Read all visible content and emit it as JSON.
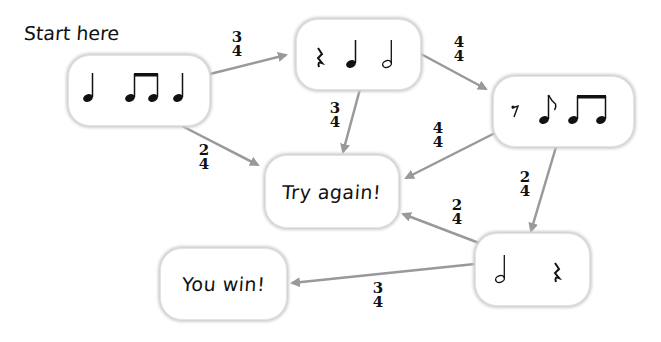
{
  "start_label": "Start here",
  "nodes": {
    "start": {
      "content": "quarter, eighth-eighth (beamed), eighth, quarter",
      "symbols": [
        "quarter-note",
        "beamed-eighth-notes",
        "quarter-note"
      ]
    },
    "top": {
      "symbols": [
        "quarter-rest",
        "quarter-note",
        "half-note"
      ]
    },
    "right": {
      "symbols": [
        "eighth-rest",
        "eighth-note",
        "beamed-eighth-notes"
      ]
    },
    "bottom_right": {
      "symbols": [
        "half-note",
        "quarter-rest"
      ]
    },
    "try_again": {
      "label": "Try again!"
    },
    "you_win": {
      "label": "You win!"
    }
  },
  "edges": [
    {
      "from": "start",
      "to": "top",
      "time_signature": {
        "top": "3",
        "bottom": "4"
      }
    },
    {
      "from": "start",
      "to": "try_again",
      "time_signature": {
        "top": "2",
        "bottom": "4"
      }
    },
    {
      "from": "top",
      "to": "right",
      "time_signature": {
        "top": "4",
        "bottom": "4"
      }
    },
    {
      "from": "top",
      "to": "try_again",
      "time_signature": {
        "top": "3",
        "bottom": "4"
      }
    },
    {
      "from": "right",
      "to": "try_again",
      "time_signature": {
        "top": "4",
        "bottom": "4"
      }
    },
    {
      "from": "right",
      "to": "bottom_right",
      "time_signature": {
        "top": "2",
        "bottom": "4"
      }
    },
    {
      "from": "bottom_right",
      "to": "try_again",
      "time_signature": {
        "top": "2",
        "bottom": "4"
      }
    },
    {
      "from": "bottom_right",
      "to": "you_win",
      "time_signature": {
        "top": "3",
        "bottom": "4"
      }
    }
  ],
  "colors": {
    "arrow": "#999999",
    "box_shadow": "#cfcfcf",
    "text": "#111111"
  }
}
